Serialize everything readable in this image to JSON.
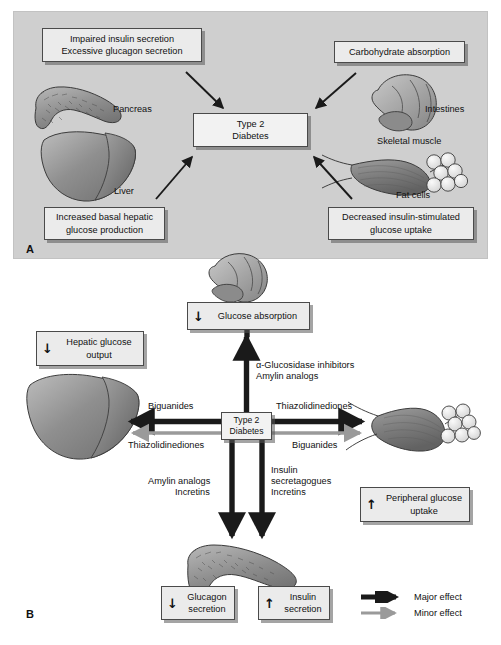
{
  "figure": {
    "background": "#ffffff",
    "panel_background": "#cfcfcf",
    "box_background": "#ebebeb",
    "box_border": "#4a4a4a",
    "major_effect_color": "#1a1a1a",
    "minor_effect_color": "#9a9a9a"
  },
  "panelA": {
    "letter": "A",
    "boxes": {
      "pancreas_defect": "Impaired insulin secretion\nExcessive glucagon secretion",
      "pancreas_defect_line1": "Impaired insulin secretion",
      "pancreas_defect_line2": "Excessive glucagon secretion",
      "carbohydrate_absorption": "Carbohydrate absorption",
      "center_line1": "Type 2",
      "center_line2": "Diabetes",
      "liver_defect_line1": "Increased basal hepatic",
      "liver_defect_line2": "glucose production",
      "muscle_defect_line1": "Decreased insulin-stimulated",
      "muscle_defect_line2": "glucose uptake"
    },
    "organ_labels": {
      "pancreas": "Pancreas",
      "intestines": "Intestines",
      "liver": "Liver",
      "skeletal_muscle": "Skeletal muscle",
      "fat_cells": "Fat cells"
    }
  },
  "panelB": {
    "letter": "B",
    "boxes": {
      "glucose_absorption_arrow": "↓",
      "glucose_absorption_text": "Glucose absorption",
      "hepatic_output_arrow": "↓",
      "hepatic_output_line1": "Hepatic glucose",
      "hepatic_output_line2": "output",
      "center_line1": "Type 2",
      "center_line2": "Diabetes",
      "peripheral_uptake_arrow": "↑",
      "peripheral_uptake_line1": "Peripheral glucose",
      "peripheral_uptake_line2": "uptake",
      "glucagon_arrow": "↓",
      "glucagon_line1": "Glucagon",
      "glucagon_line2": "secretion",
      "insulin_arrow": "↑",
      "insulin_line1": "Insulin",
      "insulin_line2": "secretion"
    },
    "drug_labels": {
      "up_line1": "α-Glucosidase inhibitors",
      "up_line2": "Amylin analogs",
      "left_major": "Biguanides",
      "left_minor": "Thiazolidinediones",
      "right_major": "Thiazolidinediones",
      "right_minor": "Biguanides",
      "down_left_line1": "Amylin analogs",
      "down_left_line2": "Incretins",
      "down_right_line1": "Insulin",
      "down_right_line2": "secretagogues",
      "down_right_line3": "Incretins"
    },
    "legend": {
      "major": "Major effect",
      "minor": "Minor effect"
    }
  },
  "icons": {
    "pancreas": "pancreas-illustration",
    "liver": "liver-illustration",
    "intestines": "intestines-illustration",
    "skeletal_muscle": "skeletal-muscle-illustration",
    "fat_cells": "fat-cells-illustration"
  }
}
